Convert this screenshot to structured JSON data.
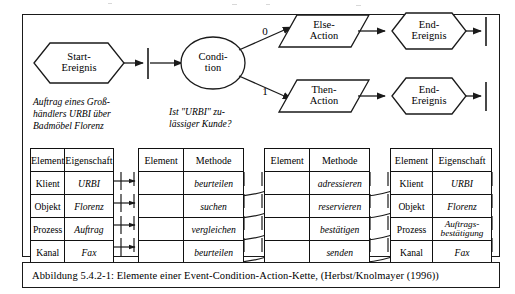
{
  "figure": {
    "caption": "Abbildung 5.4.2-1: Elemente einer Event-Condition-Action-Kette, (Herbst/Knolmayer (1996))"
  },
  "flow": {
    "nodes": [
      {
        "id": "start-event",
        "shape": "hexagon",
        "label_line1": "Start-",
        "label_line2": "Ereignis"
      },
      {
        "id": "condition",
        "shape": "ellipse",
        "label_line1": "Condi-",
        "label_line2": "tion"
      },
      {
        "id": "else-action",
        "shape": "parallelogram",
        "label_line1": "Else-",
        "label_line2": "Action"
      },
      {
        "id": "then-action",
        "shape": "parallelogram",
        "label_line1": "Then-",
        "label_line2": "Action"
      },
      {
        "id": "end-event-top",
        "shape": "hexagon",
        "label_line1": "End-",
        "label_line2": "Ereignis"
      },
      {
        "id": "end-event-bottom",
        "shape": "hexagon",
        "label_line1": "End-",
        "label_line2": "Ereignis"
      }
    ],
    "branch_labels": {
      "else": "0",
      "then": "1"
    },
    "annotations": {
      "start_note_line1": "Auftrag eines Groß-",
      "start_note_line2": "händlers URBI über",
      "start_note_line3": "Badmöbel Florenz",
      "condition_note_line1": "Ist \"URBI\" zu-",
      "condition_note_line2": "lässiger Kunde?"
    }
  },
  "tables": [
    {
      "id": "table-element-eigenschaft-1",
      "headers": [
        "Element",
        "Eigenschaft"
      ],
      "rows": [
        [
          "Klient",
          "URBI"
        ],
        [
          "Objekt",
          "Florenz"
        ],
        [
          "Prozess",
          "Auftrag"
        ],
        [
          "Kanal",
          "Fax"
        ]
      ]
    },
    {
      "id": "table-element-methode-1",
      "headers": [
        "Element",
        "Methode"
      ],
      "rows": [
        [
          "",
          "beurteilen"
        ],
        [
          "",
          "suchen"
        ],
        [
          "",
          "vergleichen"
        ],
        [
          "",
          "beurteilen"
        ]
      ]
    },
    {
      "id": "table-element-methode-2",
      "headers": [
        "Element",
        "Methode"
      ],
      "rows": [
        [
          "",
          "adressieren"
        ],
        [
          "",
          "reservieren"
        ],
        [
          "",
          "bestätigen"
        ],
        [
          "",
          "senden"
        ]
      ]
    },
    {
      "id": "table-element-eigenschaft-2",
      "headers": [
        "Element",
        "Eigenschaft"
      ],
      "rows": [
        [
          "Klient",
          "URBI"
        ],
        [
          "Objekt",
          "Florenz"
        ],
        [
          "Prozess",
          "Auftrags-\nbestätigung"
        ],
        [
          "Kanal",
          "Fax"
        ]
      ]
    }
  ],
  "colors": {
    "stroke": "#1a1a1a",
    "background": "#ffffff",
    "text": "#000000"
  }
}
